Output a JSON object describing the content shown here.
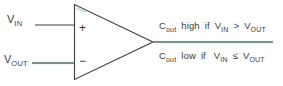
{
  "figure": {
    "type": "comparator-schematic",
    "background_color": "#ffffff",
    "line_color": "#3a3a3a",
    "accent_color": "#7fc9b0"
  },
  "inputs": {
    "noninverting": {
      "label_main": "V",
      "label_sub": "IN",
      "terminal_sign": "+"
    },
    "inverting": {
      "label_main": "V",
      "label_sub": "OUT",
      "terminal_sign": "−"
    }
  },
  "output": {
    "line_1": {
      "signal_main": "C",
      "signal_sub": "out",
      "state": "high",
      "conditional": "if",
      "left_main": "V",
      "left_sub": "IN",
      "operator": ">",
      "right_main": "V",
      "right_sub": "OUT"
    },
    "line_2": {
      "signal_main": "C",
      "signal_sub": "out",
      "state": "low",
      "conditional": "if",
      "left_main": "V",
      "left_sub": "IN",
      "operator": "≤",
      "right_main": "V",
      "right_sub": "OUT"
    }
  }
}
